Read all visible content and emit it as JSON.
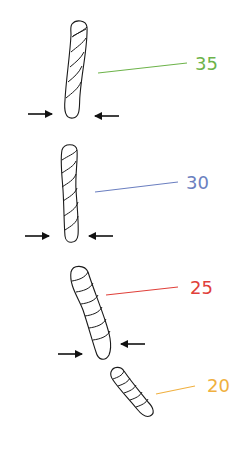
{
  "diagram": {
    "title": "",
    "colors": {
      "rope": "#1a1a1a",
      "arrow": "#111111",
      "label_35": "#6db34a",
      "label_30": "#6b7fc0",
      "label_25": "#e0403a",
      "label_20": "#f0b040"
    },
    "ropes": [
      {
        "id": "rope-35",
        "label": "35",
        "color": "#6db34a",
        "has_compression_arrows": true
      },
      {
        "id": "rope-30",
        "label": "30",
        "color": "#6b7fc0",
        "has_compression_arrows": true
      },
      {
        "id": "rope-25",
        "label": "25",
        "color": "#e0403a",
        "has_compression_arrows": true
      },
      {
        "id": "rope-20",
        "label": "20",
        "color": "#f0b040",
        "has_compression_arrows": false
      }
    ]
  }
}
